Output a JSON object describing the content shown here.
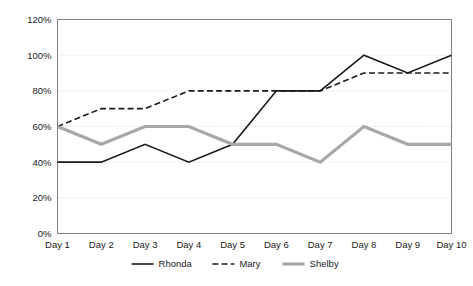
{
  "chart_data": {
    "type": "line",
    "title": "",
    "xlabel": "",
    "ylabel": "",
    "categories": [
      "Day 1",
      "Day 2",
      "Day 3",
      "Day 4",
      "Day 5",
      "Day 6",
      "Day 7",
      "Day 8",
      "Day 9",
      "Day 10"
    ],
    "ytick_labels": [
      "0%",
      "20%",
      "40%",
      "60%",
      "80%",
      "100%",
      "120%"
    ],
    "ytick_values": [
      0,
      20,
      40,
      60,
      80,
      100,
      120
    ],
    "ylim": [
      0,
      120
    ],
    "grid": true,
    "grid_axis": "y",
    "legend_position": "bottom",
    "series": [
      {
        "name": "Rhonda",
        "values": [
          40,
          40,
          50,
          40,
          50,
          80,
          80,
          100,
          90,
          100
        ],
        "color": "#1a1a1a",
        "style": "solid",
        "width": 1.6
      },
      {
        "name": "Mary",
        "values": [
          60,
          70,
          70,
          80,
          80,
          80,
          80,
          90,
          90,
          90
        ],
        "color": "#1a1a1a",
        "style": "dashed",
        "width": 1.6
      },
      {
        "name": "Shelby",
        "values": [
          60,
          50,
          60,
          60,
          50,
          50,
          40,
          60,
          50,
          50
        ],
        "color": "#a8a8a8",
        "style": "solid",
        "width": 3.2
      }
    ]
  },
  "plot": {
    "frame_color": "#808080",
    "grid_color": "#d9d9d9",
    "background": "#ffffff"
  }
}
